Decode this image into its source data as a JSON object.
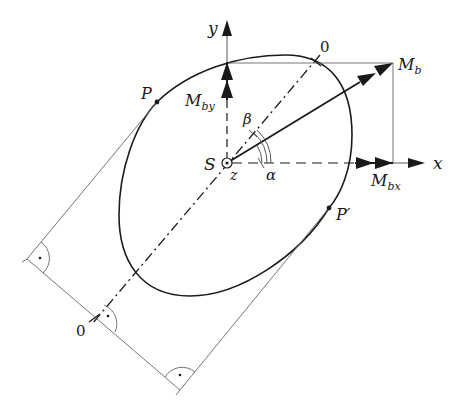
{
  "diagram": {
    "type": "bending-stress-cross-section",
    "labels": {
      "axis_y": "y",
      "axis_x": "x",
      "axis_z": "z",
      "centroid": "S",
      "moment": "M",
      "moment_sub": "b",
      "moment_y": "M",
      "moment_y_sub": "by",
      "moment_x": "M",
      "moment_x_sub": "bx",
      "angle_alpha": "α",
      "angle_beta": "β",
      "point_p": "P",
      "point_p_prime": "P′",
      "neutral_axis_top": "0",
      "neutral_axis_bottom": "0"
    },
    "colors": {
      "stroke": "#1a1a1a",
      "thin_stroke": "#555555",
      "background": "#ffffff"
    }
  }
}
